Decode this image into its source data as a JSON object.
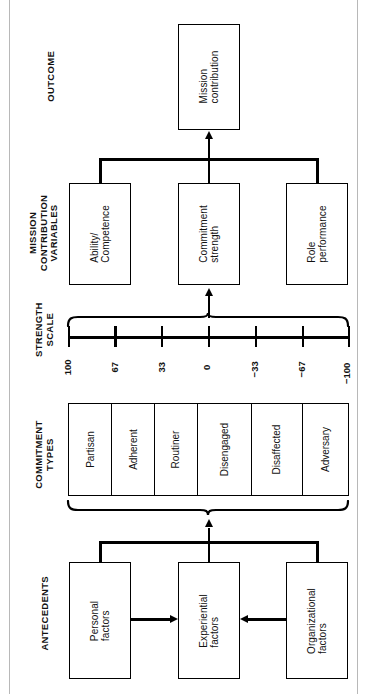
{
  "diagram": {
    "orientation": "rotated-90-ccw",
    "sections": [
      {
        "key": "outcome",
        "label": "OUTCOME"
      },
      {
        "key": "mcv",
        "label": "MISSION\nCONTRIBUTION\nVARIABLES"
      },
      {
        "key": "scale",
        "label": "STRENGTH\nSCALE"
      },
      {
        "key": "types",
        "label": "COMMITMENT\nTYPES"
      },
      {
        "key": "antecedents",
        "label": "ANTECEDENTS"
      }
    ],
    "outcome": {
      "box": {
        "label": "Mission\ncontribution"
      }
    },
    "mission_contribution_variables": {
      "boxes": [
        {
          "label": "Ability/\nCompetence"
        },
        {
          "label": "Commitment\nstrength"
        },
        {
          "label": "Role\nperformance"
        }
      ]
    },
    "strength_scale": {
      "ticks": [
        "100",
        "67",
        "33",
        "0",
        "−33",
        "−67",
        "−100"
      ]
    },
    "commitment_types": {
      "cells": [
        {
          "label": "Partisan"
        },
        {
          "label": "Adherent"
        },
        {
          "label": "Routiner"
        },
        {
          "label": "Disengaged"
        },
        {
          "label": "Disaffected"
        },
        {
          "label": "Adversary"
        }
      ]
    },
    "antecedents": {
      "boxes": [
        {
          "label": "Personal\nfactors"
        },
        {
          "label": "Experiential\nfactors"
        },
        {
          "label": "Organizational\nfactors"
        }
      ]
    },
    "colors": {
      "ink": "#000000",
      "paper": "#ffffff",
      "page_rule": "#b8b8b8"
    }
  }
}
